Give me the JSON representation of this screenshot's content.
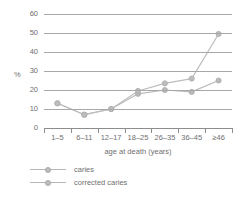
{
  "chart_data": {
    "type": "line",
    "title": "",
    "xlabel": "age at death (years)",
    "ylabel": "%",
    "categories": [
      "1–5",
      "6–11",
      "12–17",
      "18–25",
      "26–35",
      "36–45",
      "≥46"
    ],
    "ylim": [
      0,
      60
    ],
    "yticks": [
      0,
      10,
      20,
      30,
      40,
      50,
      60
    ],
    "ytick_labels": [
      "0",
      "10",
      "20",
      "30",
      "40",
      "50",
      "60"
    ],
    "grid": true,
    "legend_position": "below",
    "series": [
      {
        "name": "caries",
        "color": "#b9b9b9",
        "values": [
          13,
          7,
          10,
          18,
          20,
          19,
          25
        ]
      },
      {
        "name": "corrected caries",
        "color": "#bdbdbd",
        "values": [
          13,
          7,
          10,
          19.5,
          23.5,
          26,
          49.5
        ]
      }
    ]
  },
  "legend": {
    "items": [
      {
        "label": "caries"
      },
      {
        "label": "corrected caries"
      }
    ]
  },
  "colors": {
    "gridline": "#a8a8a8",
    "axis": "#8d8d8d",
    "text": "#6f6f6f",
    "series": "#bdbdbd",
    "background": "#ffffff"
  }
}
